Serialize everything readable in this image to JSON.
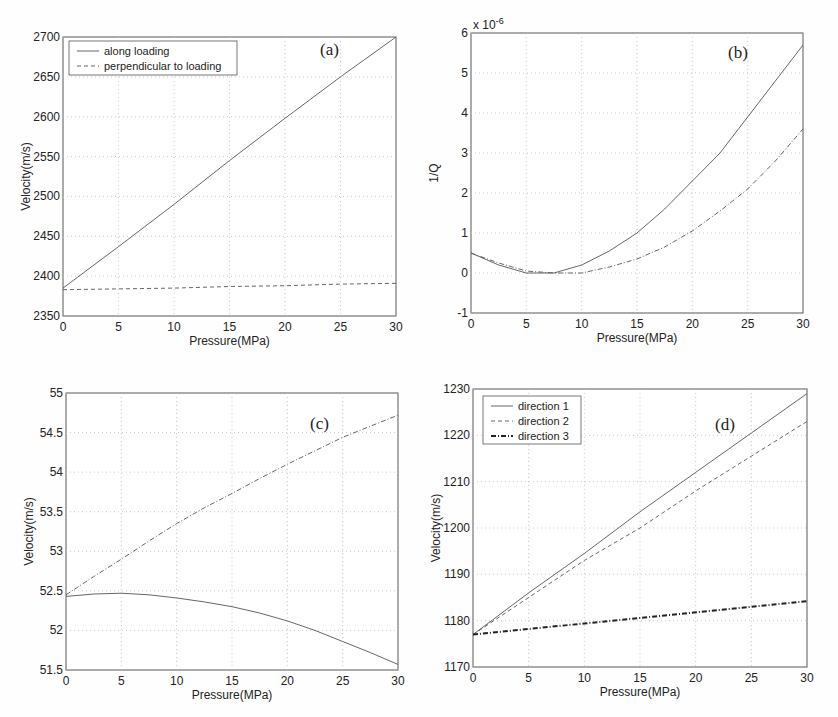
{
  "chart_data": [
    {
      "id": "a",
      "type": "line",
      "panel_label": "(a)",
      "xlabel": "Pressure(MPa)",
      "ylabel": "Velocity(m/s)",
      "xlim": [
        0,
        30
      ],
      "ylim": [
        2350,
        2700
      ],
      "xticks": [
        0,
        5,
        10,
        15,
        20,
        25,
        30
      ],
      "yticks": [
        2350,
        2400,
        2450,
        2500,
        2550,
        2600,
        2650,
        2700
      ],
      "grid": true,
      "legend_position": "upper left",
      "x": [
        0,
        5,
        10,
        15,
        20,
        25,
        30
      ],
      "series": [
        {
          "name": "along loading",
          "style": "solid",
          "values": [
            2385,
            2437,
            2490,
            2545,
            2598,
            2650,
            2700
          ]
        },
        {
          "name": "perpendicular to loading",
          "style": "dashed",
          "values": [
            2383,
            2384,
            2385,
            2387,
            2388,
            2390,
            2391
          ]
        }
      ]
    },
    {
      "id": "b",
      "type": "line",
      "panel_label": "(b)",
      "xlabel": "Pressure(MPa)",
      "ylabel": "1/Q",
      "y_multiplier": "x 10^-6",
      "xlim": [
        0,
        30
      ],
      "ylim": [
        -1,
        6
      ],
      "xticks": [
        0,
        5,
        10,
        15,
        20,
        25,
        30
      ],
      "yticks": [
        -1,
        0,
        1,
        2,
        3,
        4,
        5,
        6
      ],
      "grid": true,
      "x": [
        0,
        2.5,
        5,
        7.5,
        10,
        12.5,
        15,
        17.5,
        20,
        22.5,
        25,
        27.5,
        30
      ],
      "series": [
        {
          "name": "solid",
          "style": "solid",
          "values": [
            0.5,
            0.2,
            0.0,
            0.0,
            0.2,
            0.55,
            1.0,
            1.6,
            2.3,
            3.0,
            3.9,
            4.8,
            5.7
          ]
        },
        {
          "name": "dash-dot",
          "style": "dashdot",
          "values": [
            0.5,
            0.25,
            0.05,
            0.0,
            0.0,
            0.15,
            0.35,
            0.65,
            1.05,
            1.55,
            2.1,
            2.8,
            3.6
          ]
        }
      ]
    },
    {
      "id": "c",
      "type": "line",
      "panel_label": "(c)",
      "xlabel": "Pressure(MPa)",
      "ylabel": "Velocity(m/s)",
      "xlim": [
        0,
        30
      ],
      "ylim": [
        51.5,
        55
      ],
      "xticks": [
        0,
        5,
        10,
        15,
        20,
        25,
        30
      ],
      "yticks": [
        "51.5",
        "52",
        "52.5",
        "53",
        "53.5",
        "54",
        "54.5",
        "55"
      ],
      "grid": true,
      "x": [
        0,
        2.5,
        5,
        7.5,
        10,
        12.5,
        15,
        17.5,
        20,
        22.5,
        25,
        27.5,
        30
      ],
      "series": [
        {
          "name": "dash-dot",
          "style": "dashdot",
          "values": [
            52.45,
            52.68,
            52.9,
            53.13,
            53.35,
            53.55,
            53.73,
            53.92,
            54.1,
            54.27,
            54.44,
            54.58,
            54.72
          ]
        },
        {
          "name": "solid",
          "style": "solid",
          "values": [
            52.43,
            52.46,
            52.47,
            52.45,
            52.41,
            52.36,
            52.3,
            52.22,
            52.12,
            52.0,
            51.86,
            51.72,
            51.57
          ]
        }
      ]
    },
    {
      "id": "d",
      "type": "line",
      "panel_label": "(d)",
      "xlabel": "Pressure(MPa)",
      "ylabel": "Velocity(m/s)",
      "xlim": [
        0,
        30
      ],
      "ylim": [
        1170,
        1230
      ],
      "xticks": [
        0,
        5,
        10,
        15,
        20,
        25,
        30
      ],
      "yticks": [
        1170,
        1180,
        1190,
        1200,
        1210,
        1220,
        1230
      ],
      "grid": true,
      "legend_position": "upper left",
      "x": [
        0,
        5,
        10,
        15,
        20,
        25,
        30
      ],
      "series": [
        {
          "name": "direction 1",
          "style": "solid",
          "values": [
            1177,
            1186,
            1194.5,
            1203.5,
            1212,
            1220.5,
            1229
          ]
        },
        {
          "name": "direction 2",
          "style": "dashed",
          "values": [
            1177,
            1185,
            1193,
            1200,
            1208,
            1215.5,
            1223
          ]
        },
        {
          "name": "direction 3",
          "style": "bold-dashdot",
          "values": [
            1177,
            1178.2,
            1179.4,
            1180.6,
            1181.8,
            1183,
            1184.2
          ]
        }
      ]
    }
  ]
}
